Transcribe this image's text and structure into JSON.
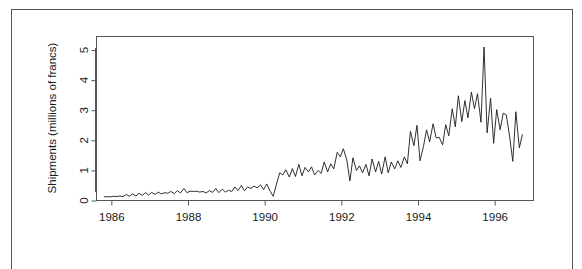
{
  "chart_data": {
    "type": "line",
    "title": "",
    "subtitle": "",
    "xlabel": "",
    "ylabel": "Shipments (millions of francs)",
    "xlim": [
      1985.6,
      1997.0
    ],
    "ylim": [
      0,
      5.45
    ],
    "xticks": [
      1986,
      1988,
      1990,
      1992,
      1994,
      1996
    ],
    "xtick_labels": [
      "1986",
      "1988",
      "1990",
      "1992",
      "1994",
      "1996"
    ],
    "yticks": [
      0,
      1,
      2,
      3,
      4,
      5
    ],
    "ytick_labels": [
      "0",
      "1",
      "2",
      "3",
      "4",
      "5"
    ],
    "grid": false,
    "legend": null,
    "legend_position": "none",
    "box": true,
    "line_color": "#1a1a1a",
    "frame_color": "#555555",
    "series": [
      {
        "name": "Shipments",
        "x": [
          1985.79,
          1985.88,
          1985.96,
          1986.04,
          1986.13,
          1986.21,
          1986.29,
          1986.38,
          1986.46,
          1986.54,
          1986.63,
          1986.71,
          1986.79,
          1986.88,
          1986.96,
          1987.04,
          1987.13,
          1987.21,
          1987.29,
          1987.38,
          1987.46,
          1987.54,
          1987.63,
          1987.71,
          1987.79,
          1987.88,
          1987.96,
          1988.04,
          1988.13,
          1988.21,
          1988.29,
          1988.38,
          1988.46,
          1988.54,
          1988.63,
          1988.71,
          1988.79,
          1988.88,
          1988.96,
          1989.04,
          1989.13,
          1989.21,
          1989.29,
          1989.38,
          1989.46,
          1989.54,
          1989.63,
          1989.71,
          1989.79,
          1989.88,
          1989.96,
          1990.04,
          1990.13,
          1990.21,
          1990.29,
          1990.38,
          1990.46,
          1990.54,
          1990.63,
          1990.71,
          1990.79,
          1990.88,
          1990.96,
          1991.04,
          1991.13,
          1991.21,
          1991.29,
          1991.38,
          1991.46,
          1991.54,
          1991.63,
          1991.71,
          1991.79,
          1991.88,
          1991.96,
          1992.04,
          1992.13,
          1992.21,
          1992.29,
          1992.38,
          1992.46,
          1992.54,
          1992.63,
          1992.71,
          1992.79,
          1992.88,
          1992.96,
          1993.04,
          1993.13,
          1993.21,
          1993.29,
          1993.38,
          1993.46,
          1993.54,
          1993.63,
          1993.71,
          1993.79,
          1993.88,
          1993.96,
          1994.04,
          1994.13,
          1994.21,
          1994.29,
          1994.38,
          1994.46,
          1994.54,
          1994.63,
          1994.71,
          1994.79,
          1994.88,
          1994.96,
          1995.04,
          1995.13,
          1995.21,
          1995.29,
          1995.38,
          1995.46,
          1995.54,
          1995.63,
          1995.71,
          1995.79,
          1995.88,
          1995.96,
          1996.04,
          1996.13,
          1996.21,
          1996.29,
          1996.38,
          1996.46,
          1996.54,
          1996.63,
          1996.71
        ],
        "values": [
          0.12,
          0.13,
          0.12,
          0.14,
          0.13,
          0.15,
          0.13,
          0.2,
          0.14,
          0.22,
          0.15,
          0.24,
          0.17,
          0.26,
          0.18,
          0.27,
          0.2,
          0.28,
          0.22,
          0.26,
          0.24,
          0.3,
          0.23,
          0.33,
          0.25,
          0.4,
          0.26,
          0.31,
          0.3,
          0.31,
          0.28,
          0.3,
          0.25,
          0.33,
          0.27,
          0.4,
          0.26,
          0.38,
          0.28,
          0.34,
          0.3,
          0.45,
          0.33,
          0.5,
          0.32,
          0.45,
          0.4,
          0.48,
          0.42,
          0.52,
          0.36,
          0.55,
          0.31,
          0.14,
          0.52,
          0.92,
          0.85,
          1.02,
          0.78,
          1.06,
          0.8,
          1.2,
          0.82,
          1.1,
          0.95,
          1.12,
          0.85,
          1.0,
          0.9,
          1.28,
          0.95,
          1.22,
          1.05,
          1.6,
          1.45,
          1.72,
          1.35,
          0.65,
          1.42,
          1.0,
          1.15,
          0.92,
          1.2,
          0.82,
          1.38,
          0.95,
          1.3,
          0.88,
          1.45,
          0.92,
          1.28,
          1.05,
          1.32,
          1.1,
          1.45,
          1.22,
          2.3,
          1.82,
          2.5,
          1.32,
          1.8,
          2.35,
          1.95,
          2.55,
          2.08,
          2.1,
          1.85,
          2.52,
          2.15,
          3.05,
          2.45,
          3.48,
          2.62,
          3.32,
          2.75,
          3.6,
          3.05,
          3.55,
          2.6,
          5.1,
          2.25,
          3.4,
          1.9,
          3.02,
          2.35,
          2.9,
          2.85,
          2.1,
          1.3,
          2.95,
          1.75,
          2.2
        ]
      }
    ],
    "notes": {
      "description": "Monthly shipments time series, 1986 through late 1996, rising from about 0.1 to peaks above 5 million francs.",
      "peak_value": 5.1,
      "peak_x": 1995.71,
      "min_value": 0.12,
      "n_points": 129
    }
  },
  "axis": {
    "ylabel": "Shipments (millions of francs)"
  }
}
